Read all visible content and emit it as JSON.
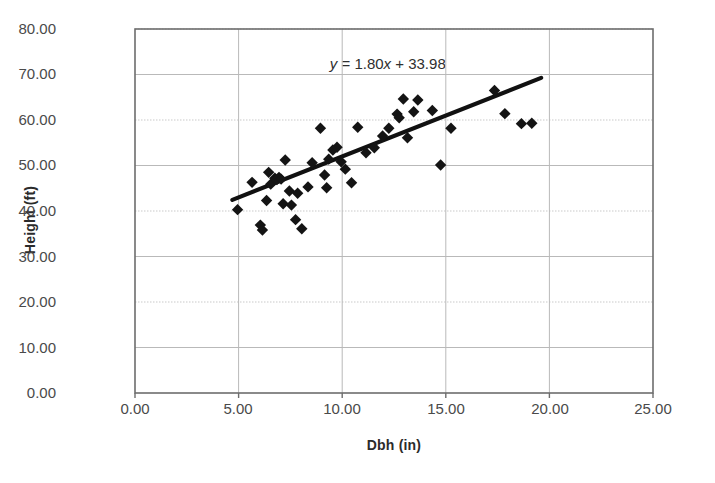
{
  "chart_data": {
    "type": "scatter",
    "title": "",
    "xlabel": "Dbh (in)",
    "ylabel": "Height (ft)",
    "xlim": [
      0,
      25
    ],
    "ylim": [
      0,
      80
    ],
    "xticks": [
      "0.00",
      "5.00",
      "10.00",
      "15.00",
      "20.00",
      "25.00"
    ],
    "yticks": [
      "0.00",
      "10.00",
      "20.00",
      "30.00",
      "40.00",
      "50.00",
      "60.00",
      "70.00",
      "80.00"
    ],
    "xtick_values": [
      0,
      5,
      10,
      15,
      20,
      25
    ],
    "ytick_values": [
      0,
      10,
      20,
      30,
      40,
      50,
      60,
      70,
      80
    ],
    "grid": true,
    "legend": false,
    "annotation": "y = 1.80x + 33.98",
    "annotation_parts": {
      "y": "y",
      "equals": " = ",
      "slope": "1.80",
      "x": "x",
      "plus": " + ",
      "intercept": "33.98"
    },
    "trendline": {
      "slope": 1.8,
      "intercept": 33.98,
      "x_start": 4.7,
      "x_end": 19.6,
      "color": "#111111"
    },
    "marker": {
      "shape": "diamond",
      "color": "#141414",
      "size": 9
    },
    "series": [
      {
        "name": "Trees",
        "points": [
          [
            4.95,
            40.3
          ],
          [
            5.65,
            46.3
          ],
          [
            6.05,
            36.9
          ],
          [
            6.15,
            35.8
          ],
          [
            6.35,
            42.3
          ],
          [
            6.45,
            48.5
          ],
          [
            6.55,
            45.9
          ],
          [
            6.75,
            47.2
          ],
          [
            6.85,
            46.9
          ],
          [
            6.95,
            47.4
          ],
          [
            7.05,
            47.0
          ],
          [
            7.15,
            41.6
          ],
          [
            7.25,
            51.2
          ],
          [
            7.45,
            44.4
          ],
          [
            7.55,
            41.3
          ],
          [
            7.75,
            38.1
          ],
          [
            7.85,
            43.9
          ],
          [
            8.05,
            36.1
          ],
          [
            8.35,
            45.3
          ],
          [
            8.55,
            50.6
          ],
          [
            8.95,
            58.2
          ],
          [
            9.15,
            47.9
          ],
          [
            9.25,
            45.1
          ],
          [
            9.35,
            51.4
          ],
          [
            9.55,
            53.4
          ],
          [
            9.75,
            54.0
          ],
          [
            9.95,
            50.8
          ],
          [
            10.15,
            49.2
          ],
          [
            10.45,
            46.2
          ],
          [
            10.75,
            58.4
          ],
          [
            11.15,
            52.8
          ],
          [
            11.55,
            53.9
          ],
          [
            11.95,
            56.5
          ],
          [
            12.25,
            58.2
          ],
          [
            12.65,
            61.3
          ],
          [
            12.75,
            60.5
          ],
          [
            12.95,
            64.6
          ],
          [
            13.15,
            56.1
          ],
          [
            13.45,
            61.8
          ],
          [
            13.65,
            64.4
          ],
          [
            14.35,
            62.1
          ],
          [
            14.75,
            50.1
          ],
          [
            15.25,
            58.2
          ],
          [
            17.35,
            66.5
          ],
          [
            17.85,
            61.4
          ],
          [
            18.65,
            59.2
          ],
          [
            19.15,
            59.3
          ]
        ]
      }
    ]
  },
  "axes": {
    "x_title": "Dbh (in)",
    "y_title": "Height (ft)"
  }
}
